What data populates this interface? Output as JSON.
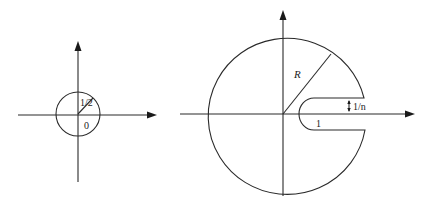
{
  "figure": {
    "left_panel": {
      "description": "Disk of radius 1/2 centered at origin",
      "labels": {
        "radius": "1/2",
        "center": "0"
      }
    },
    "right_panel": {
      "description": "Keyhole contour: large circle of radius R with a slit of width 1/n around the positive real axis starting at 1",
      "labels": {
        "radius": "R",
        "slit_width": "1/n",
        "slit_start": "1"
      }
    },
    "colors": {
      "stroke": "#2a2a2a",
      "background": "#ffffff"
    }
  }
}
